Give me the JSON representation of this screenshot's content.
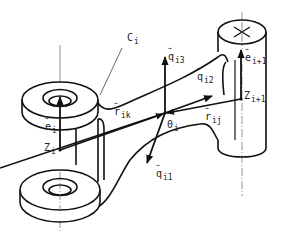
{
  "figure": {
    "colors": {
      "ink": "#111111",
      "thin_ink": "#555555",
      "background": "#ffffff"
    }
  },
  "labels": {
    "body": {
      "base": "C",
      "sub": "i"
    },
    "q3": {
      "base": "q",
      "sub": "i3",
      "vector": true
    },
    "q2": {
      "base": "q",
      "sub": "i2",
      "vector": true
    },
    "q1": {
      "base": "q",
      "sub": "i1",
      "vector": true
    },
    "e_i": {
      "base": "e",
      "sub": "i",
      "vector": true
    },
    "e_next": {
      "base": "e",
      "sub": "i+1",
      "vector": true
    },
    "z_i": {
      "base": "Z",
      "sub": "i"
    },
    "z_next": {
      "base": "Z",
      "sub": "i+1"
    },
    "r_ik": {
      "base": "r",
      "sub": "ik",
      "vector": true
    },
    "r_ij": {
      "base": "r",
      "sub": "ij",
      "vector": true
    },
    "origin": {
      "base": "0",
      "sub": "i"
    }
  }
}
